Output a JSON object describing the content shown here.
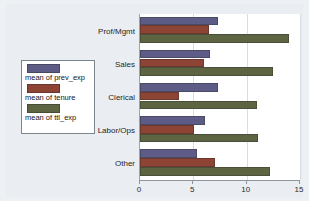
{
  "chart_data": {
    "type": "bar",
    "orientation": "horizontal",
    "title": "",
    "xlabel": "",
    "ylabel": "",
    "xlim": [
      0,
      15
    ],
    "xticks": [
      0,
      5,
      10,
      15
    ],
    "xtick_labels": [
      "0",
      "5",
      "10",
      "15"
    ],
    "grid": true,
    "grid_axis": "x",
    "legend_position": "outside-left",
    "categories": [
      "Prof/Mgmt",
      "Sales",
      "Clerical",
      "Labor/Ops",
      "Other"
    ],
    "series": [
      {
        "name": "mean of prev_exp",
        "color": "#5c5c86",
        "values": [
          7.3,
          6.6,
          7.3,
          6.1,
          5.3
        ]
      },
      {
        "name": "mean of tenure",
        "color": "#8e4435",
        "values": [
          6.5,
          6.0,
          3.7,
          5.1,
          7.0
        ]
      },
      {
        "name": "mean of ttl_exp",
        "color": "#5d6441",
        "values": [
          14.0,
          12.5,
          11.0,
          11.1,
          12.2
        ]
      }
    ]
  },
  "colors": {
    "page_background": "#eef1f4",
    "graph_region": "#eaeef2",
    "plot_background": "#ffffff",
    "axis_line": "#8d959d",
    "gridline": "#d8dde2",
    "legend_border": "#7d858d"
  }
}
